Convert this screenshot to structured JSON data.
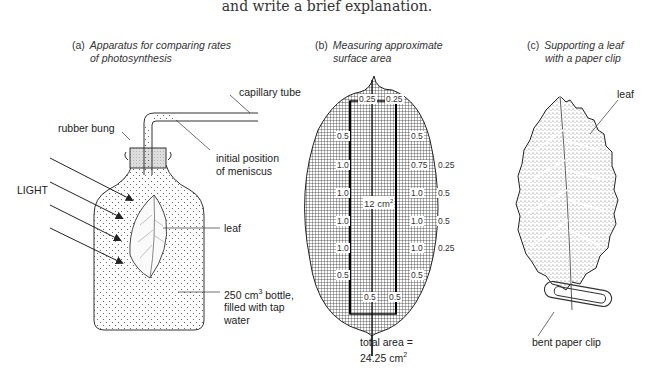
{
  "intro_text": "and write a brief explanation.",
  "panels": [
    {
      "tag": "(a)",
      "title_line1": "Apparatus for comparing rates",
      "title_line2": "of photosynthesis",
      "labels": {
        "capillary_tube": "capillary tube",
        "rubber_bung": "rubber bung",
        "meniscus_1": "initial position",
        "meniscus_2": "of meniscus",
        "light": "LIGHT",
        "leaf": "leaf",
        "bottle_1": "250 cm",
        "bottle_sup": "3",
        "bottle_1b": " bottle,",
        "bottle_2": "filled with tap",
        "bottle_3": "water"
      }
    },
    {
      "tag": "(b)",
      "title_line1": "Measuring approximate",
      "title_line2": "surface area",
      "center_label": "12 cm",
      "center_sup": "2",
      "grid_values": {
        "top_left": "0.25",
        "top_right": "0.25",
        "l1": "0.5",
        "l2": "1.0",
        "l3": "1.0",
        "l4": "1.0",
        "l5": "1.0",
        "l6": "0.5",
        "r1": "0.5",
        "r2": "0.75",
        "r3": "1.0",
        "r4": "1.0",
        "r5": "1.0",
        "r6": "0.5",
        "rr2": "0.25",
        "rr3": "0.5",
        "rr4": "0.5",
        "rr5": "0.25",
        "bottom_left": "0.5",
        "bottom_right": "0.5"
      },
      "total_1": "total area =",
      "total_2": "24.25 cm",
      "total_sup": "2"
    },
    {
      "tag": "(c)",
      "title_line1": "Supporting a leaf",
      "title_line2": "with a paper clip",
      "labels": {
        "leaf": "leaf",
        "clip": "bent paper clip"
      }
    }
  ]
}
